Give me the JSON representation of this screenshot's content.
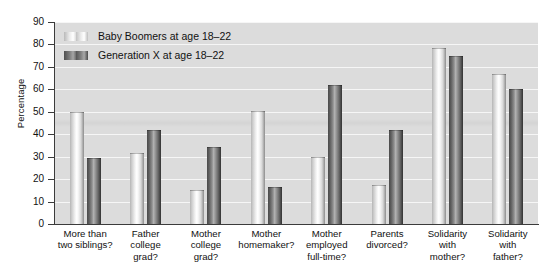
{
  "chart_data": {
    "type": "bar",
    "title": "",
    "xlabel": "",
    "ylabel": "Percentage",
    "ylim": [
      0,
      90
    ],
    "ytick_values": [
      0,
      10,
      20,
      30,
      40,
      50,
      60,
      70,
      80,
      90
    ],
    "ytick_labels": [
      "0",
      "10",
      "20",
      "30",
      "40",
      "50",
      "60",
      "70",
      "80",
      "90"
    ],
    "grid": "horizontal",
    "legend_position": "inside top-left",
    "categories": [
      "More than two siblings?",
      "Father college grad?",
      "Mother college grad?",
      "Mother homemaker?",
      "Mother employed full-time?",
      "Parents divorced?",
      "Solidarity with mother?",
      "Solidarity with father?"
    ],
    "category_lines": [
      [
        "More than",
        "two siblings?"
      ],
      [
        "Father",
        "college",
        "grad?"
      ],
      [
        "Mother",
        "college",
        "grad?"
      ],
      [
        "Mother",
        "homemaker?"
      ],
      [
        "Mother",
        "employed",
        "full-time?"
      ],
      [
        "Parents",
        "divorced?"
      ],
      [
        "Solidarity",
        "with",
        "mother?"
      ],
      [
        "Solidarity",
        "with",
        "father?"
      ]
    ],
    "series": [
      {
        "name": "Baby Boomers at age 18–22",
        "color": "#e8e8e8",
        "values": [
          50,
          31.5,
          15,
          50.5,
          30,
          17.5,
          78.5,
          67
        ]
      },
      {
        "name": "Generation X at age 18–22",
        "color": "#6b6b6b",
        "values": [
          29.5,
          42,
          34.5,
          16.5,
          62,
          42,
          75,
          60
        ]
      }
    ]
  },
  "legend": {
    "items": [
      {
        "label": "Baby Boomers at age 18–22",
        "swatch": "light-gray-bar-swatch"
      },
      {
        "label": "Generation X at age 18–22",
        "swatch": "dark-gray-bar-swatch"
      }
    ]
  },
  "axes": {
    "y_title": "Percentage"
  }
}
